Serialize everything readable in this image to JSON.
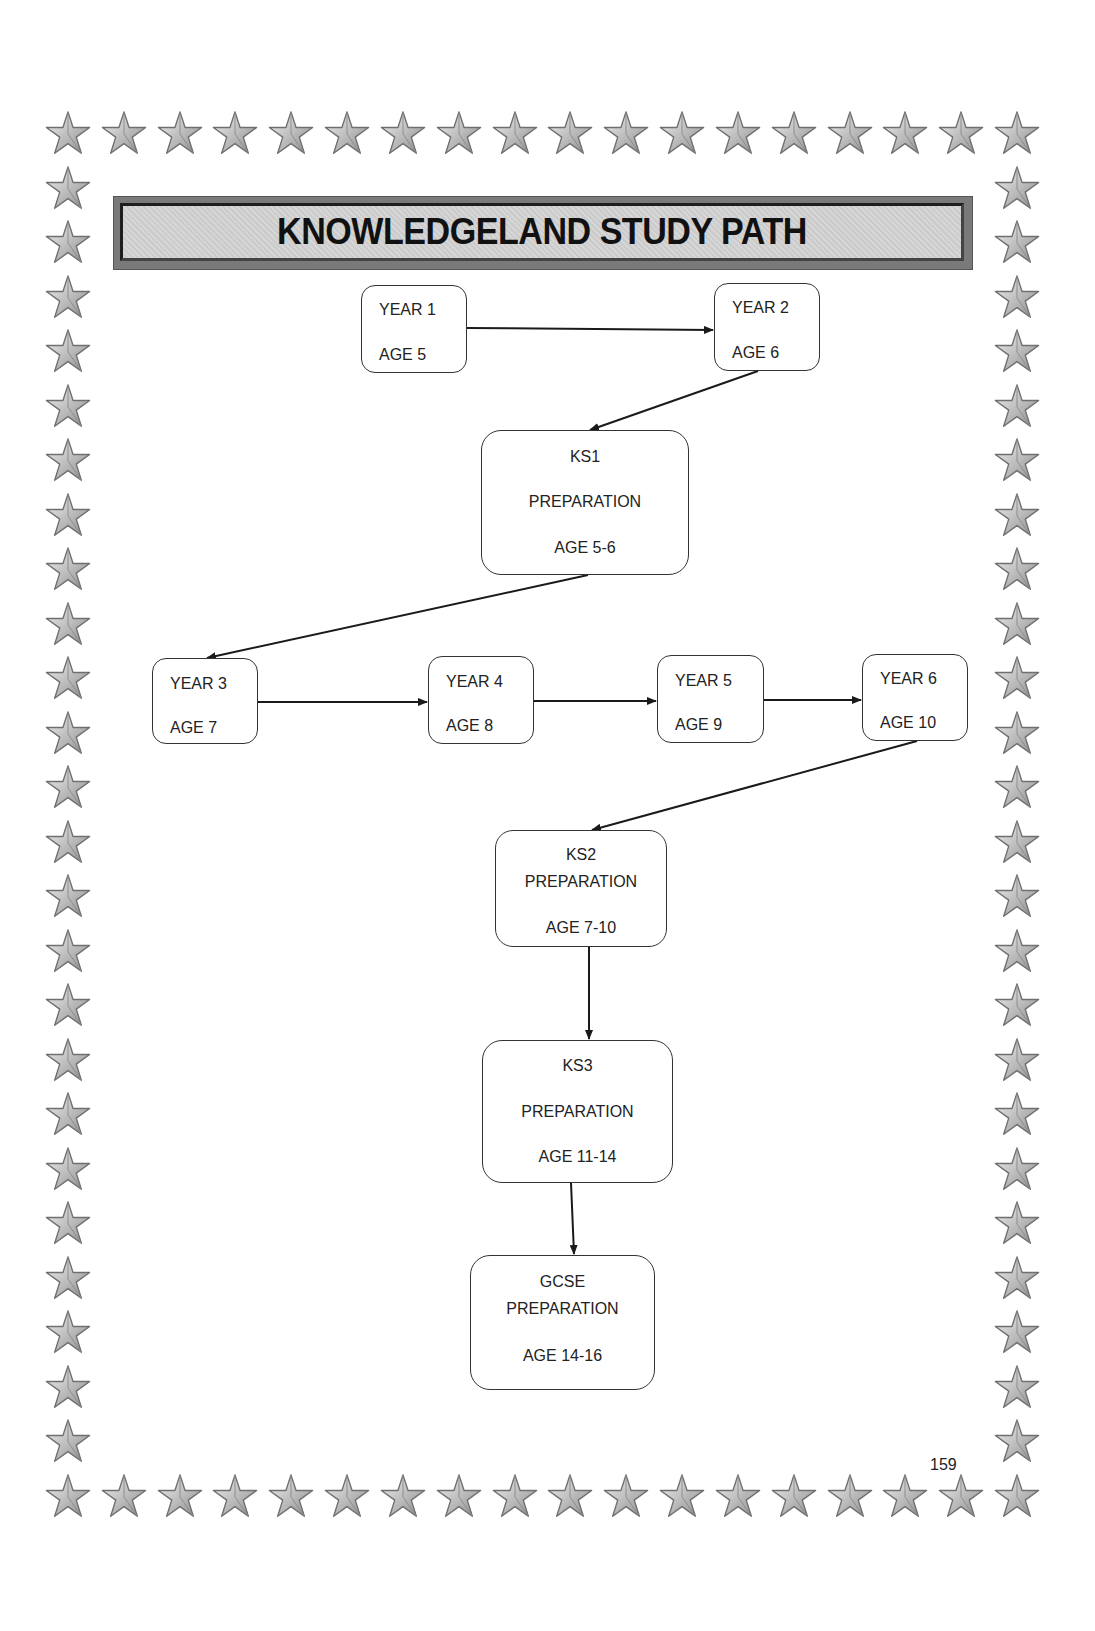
{
  "title": "KNOWLEDGELAND STUDY PATH",
  "page_number": "159",
  "border": {
    "icon": "star-icon",
    "color": "#9a9a9a"
  },
  "diagram": {
    "nodes": [
      {
        "id": "year1",
        "lines": [
          "YEAR 1",
          "AGE 5"
        ]
      },
      {
        "id": "year2",
        "lines": [
          "YEAR 2",
          "AGE 6"
        ]
      },
      {
        "id": "ks1",
        "lines": [
          "KS1",
          "PREPARATION",
          "AGE 5-6"
        ]
      },
      {
        "id": "year3",
        "lines": [
          "YEAR 3",
          "AGE 7"
        ]
      },
      {
        "id": "year4",
        "lines": [
          "YEAR 4",
          "AGE 8"
        ]
      },
      {
        "id": "year5",
        "lines": [
          "YEAR 5",
          "AGE 9"
        ]
      },
      {
        "id": "year6",
        "lines": [
          "YEAR 6",
          "AGE 10"
        ]
      },
      {
        "id": "ks2",
        "lines": [
          "KS2",
          "PREPARATION",
          "AGE 7-10"
        ]
      },
      {
        "id": "ks3",
        "lines": [
          "KS3",
          "PREPARATION",
          "AGE 11-14"
        ]
      },
      {
        "id": "gcse",
        "lines": [
          "GCSE",
          "PREPARATION",
          "AGE 14-16"
        ]
      }
    ],
    "edges": [
      [
        "year1",
        "year2"
      ],
      [
        "year2",
        "ks1"
      ],
      [
        "ks1",
        "year3"
      ],
      [
        "year3",
        "year4"
      ],
      [
        "year4",
        "year5"
      ],
      [
        "year5",
        "year6"
      ],
      [
        "year6",
        "ks2"
      ],
      [
        "ks2",
        "ks3"
      ],
      [
        "ks3",
        "gcse"
      ]
    ]
  }
}
